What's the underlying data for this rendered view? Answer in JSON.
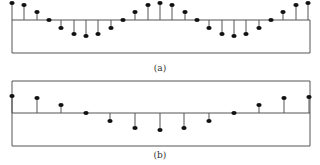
{
  "chart_data": [
    {
      "type": "stem",
      "label": "(a)",
      "box": {
        "x0": 12,
        "x1": 310,
        "axis_y": 20,
        "bottom": 53
      },
      "x": [
        12,
        24,
        37,
        49,
        61,
        74,
        86,
        98,
        111,
        123,
        135,
        148,
        160,
        172,
        185,
        197,
        209,
        222,
        234,
        246,
        259,
        271,
        283,
        296,
        308
      ],
      "y": [
        3,
        5,
        12,
        20,
        28,
        34,
        36,
        34,
        28,
        20,
        12,
        5,
        3,
        5,
        12,
        20,
        28,
        34,
        36,
        34,
        28,
        20,
        12,
        5,
        3
      ]
    },
    {
      "type": "stem",
      "label": "(b)",
      "box": {
        "x0": 12,
        "x1": 310,
        "top": 81,
        "axis_y": 113,
        "bottom": 146
      },
      "x": [
        12,
        37,
        61,
        86,
        110,
        135,
        160,
        184,
        209,
        234,
        259,
        284,
        309
      ],
      "y": [
        96,
        98,
        105,
        113,
        121,
        128,
        130,
        128,
        121,
        113,
        105,
        98,
        97
      ]
    }
  ],
  "labels": {
    "a": "(a)",
    "b": "(b)"
  },
  "colors": {
    "line": "#555555",
    "dot": "#111111"
  }
}
